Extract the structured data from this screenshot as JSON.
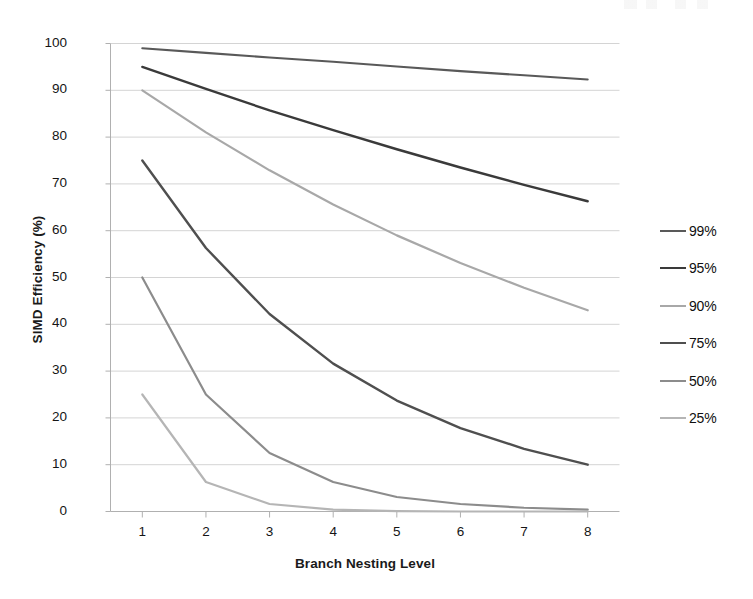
{
  "chart_data": {
    "type": "line",
    "title": "",
    "xlabel": "Branch Nesting Level",
    "ylabel": "SIMD Efficiency (%)",
    "x": [
      1,
      2,
      3,
      4,
      5,
      6,
      7,
      8
    ],
    "xlim": [
      0.5,
      8.5
    ],
    "ylim": [
      0,
      100
    ],
    "yticks": [
      0,
      10,
      20,
      30,
      40,
      50,
      60,
      70,
      80,
      90,
      100
    ],
    "xticks": [
      1,
      2,
      3,
      4,
      5,
      6,
      7,
      8
    ],
    "ytick_labels": [
      "0",
      "10",
      "20",
      "30",
      "40",
      "50",
      "60",
      "70",
      "80",
      "90",
      "100"
    ],
    "xtick_labels": [
      "1",
      "2",
      "3",
      "4",
      "5",
      "6",
      "7",
      "8"
    ],
    "grid": "horizontal",
    "legend_position": "right",
    "series": [
      {
        "name": "99%",
        "color": "#595959",
        "width": 2.1,
        "values": [
          99.0,
          98.0,
          97.0,
          96.1,
          95.1,
          94.1,
          93.2,
          92.3
        ]
      },
      {
        "name": "95%",
        "color": "#3a3a3a",
        "width": 2.4,
        "values": [
          95.0,
          90.3,
          85.7,
          81.5,
          77.4,
          73.5,
          69.8,
          66.3
        ]
      },
      {
        "name": "90%",
        "color": "#a8a8a8",
        "width": 2.2,
        "values": [
          90.0,
          81.0,
          72.9,
          65.6,
          59.0,
          53.1,
          47.8,
          43.0
        ]
      },
      {
        "name": "75%",
        "color": "#4f4f4f",
        "width": 2.4,
        "values": [
          75.0,
          56.3,
          42.2,
          31.6,
          23.7,
          17.8,
          13.4,
          10.0
        ]
      },
      {
        "name": "50%",
        "color": "#8c8c8c",
        "width": 2.2,
        "values": [
          50.0,
          25.0,
          12.5,
          6.3,
          3.1,
          1.6,
          0.8,
          0.4
        ]
      },
      {
        "name": "25%",
        "color": "#b5b5b5",
        "width": 2.2,
        "values": [
          25.0,
          6.3,
          1.6,
          0.4,
          0.1,
          0.0,
          0.0,
          0.0
        ]
      }
    ]
  },
  "axes": {
    "grid_color": "#d4d4d4",
    "axis_color": "#b0b0b0",
    "background": "#ffffff"
  }
}
